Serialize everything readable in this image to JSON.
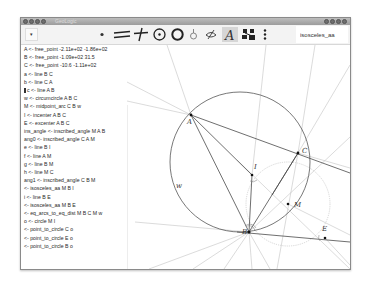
{
  "window": {
    "title": "GeoLogic",
    "controls_left": [
      "close",
      "minimize",
      "maximize",
      "menu"
    ],
    "controls_right": [
      "menu",
      "minimize",
      "maximize",
      "close"
    ]
  },
  "toolbar": {
    "dropdown_icon": "▾",
    "tools": [
      {
        "name": "point-tool",
        "glyph": "•"
      },
      {
        "name": "parallel-tool",
        "glyph": "parallel-lines"
      },
      {
        "name": "perpendicular-tool",
        "glyph": "perpendicular"
      },
      {
        "name": "circle-center-tool",
        "glyph": "circle-with-center"
      },
      {
        "name": "circle-tool",
        "glyph": "circle"
      },
      {
        "name": "hide-tool",
        "glyph": "bulb"
      },
      {
        "name": "visibility-tool",
        "glyph": "eye-slash"
      },
      {
        "name": "label-tool",
        "glyph": "A",
        "active": true
      },
      {
        "name": "reasoning-tool",
        "glyph": "network"
      },
      {
        "name": "more-tool",
        "glyph": "⋮"
      }
    ],
    "name_input_value": "isosceles_aa"
  },
  "steps": [
    "A <- free_point -2.11e+02 -1.86e+02",
    "B <- free_point -1.09e+02 31.5",
    "C <- free_point -10.6 -1.11e+02",
    "a <- line  B  C",
    "b <- line  C  A",
    "c <- line  A  B",
    "w <- circumcircle  A  B  C",
    "M <- midpoint_arc  C  B  w",
    "I <- incenter  A  B  C",
    "E <- excenter  A  B  C",
    "ins_angle <- inscribed_angle  M  A  B",
    "ang0 <- inscribed_angle  C  A  M",
    "e <- line  B  I",
    "f <- line  A  M",
    "g <- line  B  M",
    "h <- line  M  C",
    "ang1 <- inscribed_angle  C  B  M",
    "<- isosceles_aa  M  B  I",
    "i <- line  B  E",
    "<- isosceles_aa  M  B  E",
    "<- eq_arcs_to_eq_dist  M  B  C  M  w",
    "o <- circle  M  I",
    "<- point_to_circle  C  o",
    "<- point_to_circle  E  o",
    "<- point_to_circle  B  o"
  ],
  "canvas": {
    "points": [
      {
        "label": "A",
        "x": 64,
        "y": 70
      },
      {
        "label": "B",
        "x": 122,
        "y": 187
      },
      {
        "label": "C",
        "x": 171,
        "y": 108
      },
      {
        "label": "I",
        "x": 125,
        "y": 130
      },
      {
        "label": "M",
        "x": 161,
        "y": 159
      },
      {
        "label": "E",
        "x": 198,
        "y": 193
      }
    ],
    "labels": {
      "A": "A",
      "B": "B",
      "C": "C",
      "I": "I",
      "M": "M",
      "E": "E",
      "w": "w"
    },
    "colors": {
      "main_line": "#4a4a4a",
      "aux_line": "#b8b8b8",
      "circle_w": "#555555",
      "circle_o": "#c4c4c4"
    }
  }
}
